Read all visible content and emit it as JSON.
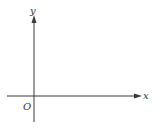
{
  "diagram": {
    "type": "coordinate-axes",
    "x_axis_label": "x",
    "y_axis_label": "y",
    "origin_label": "O",
    "colors": {
      "axis": "#3a3a3a",
      "label": "#333333",
      "background": "#ffffff"
    }
  }
}
